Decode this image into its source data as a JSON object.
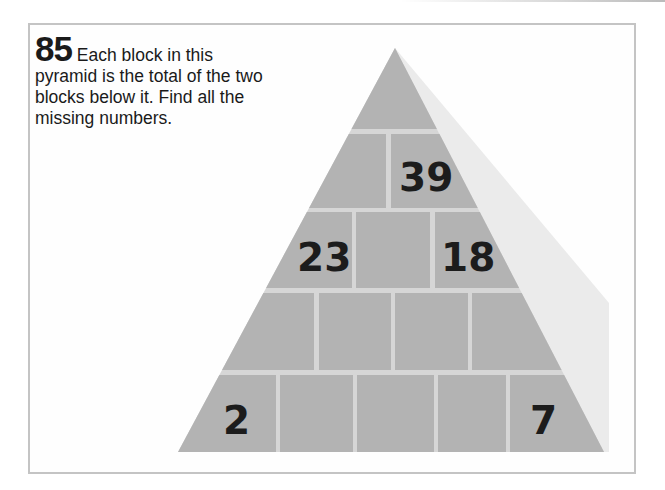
{
  "puzzle": {
    "number": "85",
    "instructions": "Each block in this pyramid is the total of the two blocks below it. Find all the missing numbers."
  },
  "pyramid": {
    "rows": [
      {
        "row": 1,
        "blocks": [
          ""
        ]
      },
      {
        "row": 2,
        "blocks": [
          "",
          "39"
        ]
      },
      {
        "row": 3,
        "blocks": [
          "23",
          "",
          "18"
        ]
      },
      {
        "row": 4,
        "blocks": [
          "",
          "",
          "",
          ""
        ]
      },
      {
        "row": 5,
        "blocks": [
          "2",
          "",
          "",
          "",
          "7"
        ]
      }
    ],
    "block_values": {
      "r2b2": "39",
      "r3b1": "23",
      "r3b3": "18",
      "r5b1": "2",
      "r5b5": "7"
    }
  },
  "colors": {
    "block_fill": "#b3b3b3",
    "mortar": "#d4d4d4",
    "shadow": "#ececec",
    "frame_border": "#c4c4c4",
    "text": "#1a1a1a"
  }
}
